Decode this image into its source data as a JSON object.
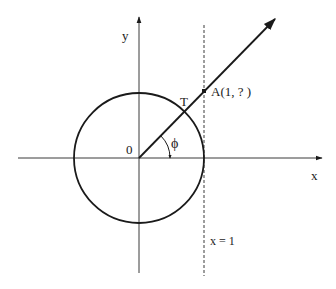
{
  "figure": {
    "type": "unit-circle-tangent-diagram",
    "colors": {
      "ink": "#1a1a1a",
      "axis": "#3a3a3a",
      "background": "#ffffff"
    },
    "labels": {
      "y_axis": "y",
      "x_axis": "x",
      "origin": "0",
      "tangent_point": "T",
      "point_a": "A(1, ? )",
      "angle": "ϕ",
      "vertical_line": "x = 1"
    },
    "geometry": {
      "origin_px": [
        139,
        158
      ],
      "circle_radius_px": 65,
      "ray_angle_deg": 45,
      "vertical_line_x_px": 204
    }
  }
}
